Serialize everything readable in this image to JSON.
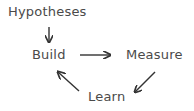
{
  "diagram": {
    "type": "cycle-flow",
    "nodes": [
      {
        "id": "hypotheses",
        "label": "Hypotheses"
      },
      {
        "id": "build",
        "label": "Build"
      },
      {
        "id": "measure",
        "label": "Measure"
      },
      {
        "id": "learn",
        "label": "Learn"
      }
    ],
    "edges": [
      {
        "from": "hypotheses",
        "to": "build"
      },
      {
        "from": "build",
        "to": "measure"
      },
      {
        "from": "measure",
        "to": "learn"
      },
      {
        "from": "learn",
        "to": "build"
      }
    ],
    "colors": {
      "text": "#4a4a4a",
      "arrow": "#333333",
      "background": "#ffffff"
    }
  }
}
